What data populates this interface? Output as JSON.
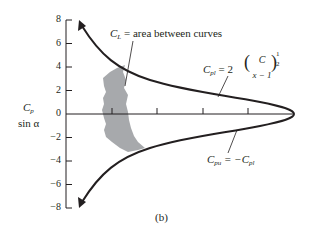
{
  "figure": {
    "caption": "(b)",
    "y_axis_label_line1": "C",
    "y_axis_label_line1_sub": "p",
    "y_axis_label_line2": "sin α",
    "y_ticks": [
      "8",
      "6",
      "4",
      "2",
      "0",
      "−2",
      "−4",
      "−6",
      "−8"
    ],
    "annotations": {
      "area_label_C": "C",
      "area_label_sub": "L",
      "area_label_text": " = area between curves",
      "upper_curve_C": "C",
      "upper_curve_sub": "pl",
      "upper_curve_eq": " = 2",
      "upper_curve_frac_num": "C",
      "upper_curve_frac_den": "x − 1",
      "upper_curve_exp_num": "1",
      "upper_curve_exp_den": "2",
      "lower_curve_C": "C",
      "lower_curve_sub": "pu",
      "lower_curve_eq": " = −C",
      "lower_curve_eq_sub": "pl"
    },
    "colors": {
      "curve": "#231f20",
      "shaded_area": "#a7a9ac",
      "axis": "#231f20"
    }
  }
}
